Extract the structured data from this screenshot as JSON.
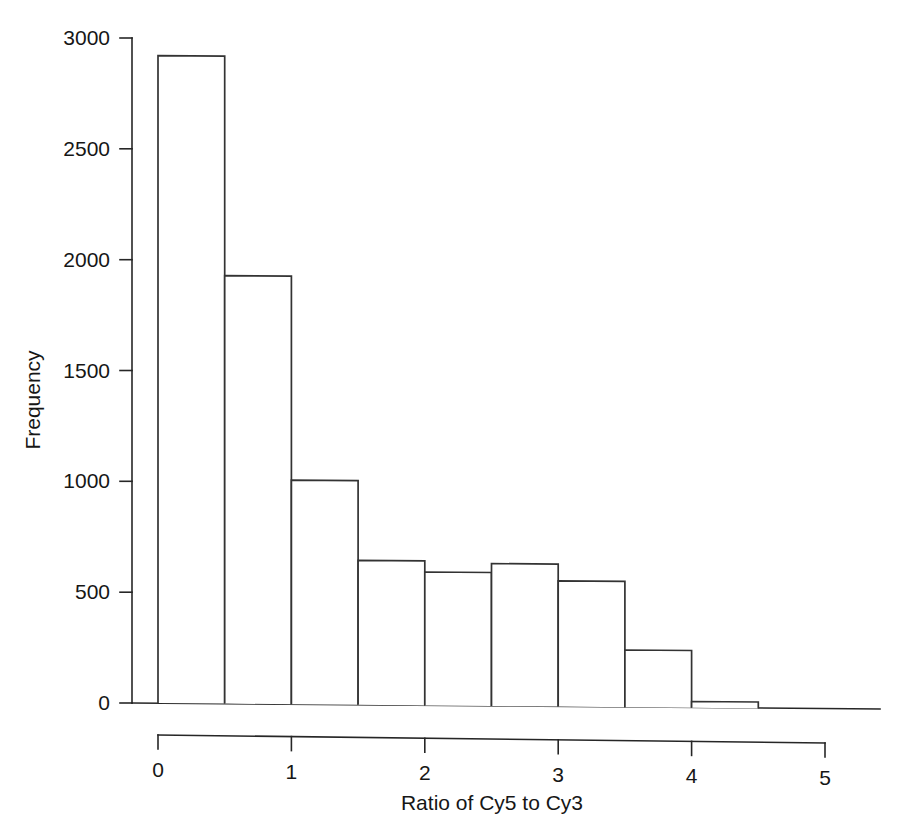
{
  "chart_data": {
    "type": "bar",
    "title": "",
    "subtitle": "",
    "xlabel": "Ratio of Cy5 to Cy3",
    "ylabel": "Frequency",
    "bin_width": 0.5,
    "bin_edges": [
      0,
      0.5,
      1.0,
      1.5,
      2.0,
      2.5,
      3.0,
      3.5,
      4.0,
      4.5
    ],
    "categories": [
      "0-0.5",
      "0.5-1",
      "1-1.5",
      "1.5-2",
      "2-2.5",
      "2.5-3",
      "3-3.5",
      "3.5-4",
      "4-4.5"
    ],
    "values": [
      2920,
      1930,
      1010,
      650,
      600,
      640,
      565,
      255,
      25
    ],
    "xlim": [
      0,
      5
    ],
    "ylim": [
      0,
      3000
    ],
    "xticks": [
      0,
      1,
      2,
      3,
      4,
      5
    ],
    "xtick_labels": [
      "0",
      "1",
      "2",
      "3",
      "4",
      "5"
    ],
    "yticks": [
      0,
      500,
      1000,
      1500,
      2000,
      2500,
      3000
    ],
    "ytick_labels": [
      "0",
      "500",
      "1000",
      "1500",
      "2000",
      "2500",
      "3000"
    ],
    "grid": false,
    "legend": null,
    "bar_fill_color": "#ffffff",
    "bar_edge_color": "#333333",
    "axis_color": "#262626",
    "background_color": "#ffffff"
  },
  "figure": {
    "y_axis_title": "Frequency",
    "x_axis_title": "Ratio of Cy5 to Cy3"
  }
}
